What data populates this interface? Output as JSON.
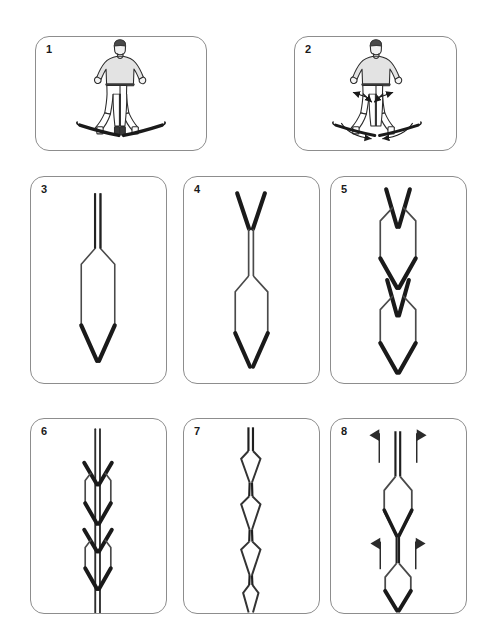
{
  "page": {
    "background_color": "#ffffff",
    "panel_border_color": "#8d8d8d",
    "ink_color": "#1a1a1a",
    "track_thin_color": "#5a5a5a",
    "skin_shade_color": "#dcdcdc",
    "columns_row1": 2,
    "columns_row2": 3,
    "columns_row3": 3
  },
  "panels": [
    {
      "number": "1",
      "kind": "skier-figure",
      "caption_number": "1",
      "description": "Skier standing in a snowplough (wedge) stance, skis tips together, tails apart",
      "x": 35,
      "y": 36,
      "w": 172,
      "h": 115
    },
    {
      "number": "2",
      "kind": "skier-figure-arrows",
      "caption_number": "2",
      "description": "Skier in snowplough stance with arrows showing knees pressing inward and ski tails pushing outward",
      "x": 294,
      "y": 36,
      "w": 163,
      "h": 115
    },
    {
      "number": "3",
      "kind": "track-straight-wedge",
      "caption_number": "3",
      "description": "Ski track: parallel tracks opening into a single long wedge ending in a braking V",
      "x": 30,
      "y": 176,
      "w": 137,
      "h": 208
    },
    {
      "number": "4",
      "kind": "track-v-then-wedge",
      "caption_number": "4",
      "description": "Ski track: wedge V at top closing to parallel, then opening into a long wedge with braking V",
      "x": 183,
      "y": 176,
      "w": 137,
      "h": 208
    },
    {
      "number": "5",
      "kind": "track-double-wedge",
      "caption_number": "5",
      "description": "Ski track: two successive wedge sections, each opening and closing, ending in a braking V",
      "x": 330,
      "y": 176,
      "w": 137,
      "h": 208
    },
    {
      "number": "6",
      "kind": "track-chevrons",
      "caption_number": "6",
      "description": "Ski track: two narrow arrow-head chevron wedges along a straight parallel track",
      "x": 30,
      "y": 418,
      "w": 137,
      "h": 196
    },
    {
      "number": "7",
      "kind": "track-lozenges",
      "caption_number": "7",
      "description": "Ski track: a chain of small diamond-shaped wedge openings along a straight track",
      "x": 183,
      "y": 418,
      "w": 137,
      "h": 196
    },
    {
      "number": "8",
      "kind": "track-lozenges-arrows",
      "caption_number": "8",
      "description": "Ski track: diamond wedge openings with flag arrows marking inward edge pressure",
      "x": 330,
      "y": 418,
      "w": 137,
      "h": 196
    }
  ],
  "legend": {
    "thin_line_meaning": "gliding ski track",
    "thick_line_meaning": "edged / braking ski track"
  }
}
